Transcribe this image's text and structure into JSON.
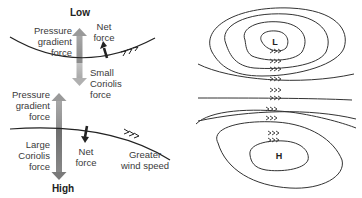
{
  "left_panel": {
    "top": {
      "title": "Low",
      "pressure_gradient_label": [
        "Pressure",
        "gradient",
        "force"
      ],
      "net_force_label": [
        "Net",
        "force"
      ],
      "coriolis_label": [
        "Small",
        "Coriolis",
        "force"
      ]
    },
    "bottom": {
      "title": "High",
      "pressure_gradient_label": [
        "Pressure",
        "gradient",
        "force"
      ],
      "coriolis_label": [
        "Large",
        "Coriolis",
        "force"
      ],
      "net_force_label": [
        "Net",
        "force"
      ],
      "wind_label": [
        "Greater",
        "wind speed"
      ]
    }
  },
  "right_panel": {
    "low_center": "L",
    "high_center": "H"
  },
  "colors": {
    "pgf_arrow_light": "#b0b0b0",
    "pgf_arrow_dark": "#7a7a7a",
    "line": "#222222",
    "text": "#3a3a3a"
  }
}
